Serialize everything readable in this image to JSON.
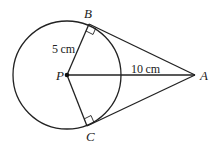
{
  "diagram": {
    "points": {
      "A": "A",
      "B": "B",
      "C": "C",
      "P": "P"
    },
    "measurements": {
      "radius": "5 cm",
      "PA": "10 cm"
    }
  }
}
